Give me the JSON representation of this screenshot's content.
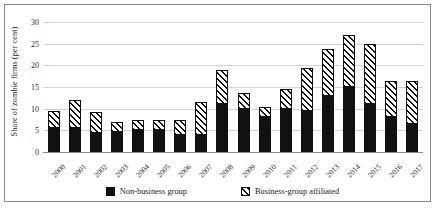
{
  "chart_data": {
    "type": "bar",
    "stacked": true,
    "title": "",
    "xlabel": "",
    "ylabel": "Share of zombie firms (per cent)",
    "ylim": [
      0,
      30
    ],
    "yticks": [
      0,
      5,
      10,
      15,
      20,
      25,
      30
    ],
    "grid": true,
    "legend_position": "bottom",
    "categories": [
      "2000",
      "2001",
      "2002",
      "2003",
      "2004",
      "2005",
      "2006",
      "2007",
      "2008",
      "2009",
      "2010",
      "2011",
      "2012",
      "2013",
      "2014",
      "2015",
      "2016",
      "2017"
    ],
    "series": [
      {
        "name": "Non-business group",
        "pattern": "solid-black",
        "color": "#111111",
        "values": [
          5.5,
          5.5,
          4.3,
          4.7,
          5.0,
          5.0,
          4.0,
          4.0,
          11.0,
          10.0,
          8.0,
          10.0,
          9.5,
          13.0,
          15.0,
          11.0,
          8.0,
          6.5
        ]
      },
      {
        "name": "Business-group affiliated",
        "pattern": "diagonal-hatch",
        "color": "#ffffff",
        "values": [
          4.0,
          6.5,
          5.0,
          2.3,
          2.5,
          2.3,
          3.3,
          7.5,
          8.0,
          3.7,
          2.3,
          4.5,
          10.0,
          10.7,
          12.0,
          14.0,
          8.5,
          10.0
        ]
      }
    ],
    "totals": [
      9.5,
      12.0,
      9.3,
      7.0,
      7.5,
      7.3,
      7.3,
      11.5,
      19.0,
      13.7,
      10.3,
      14.5,
      19.5,
      23.7,
      27.0,
      25.0,
      16.5,
      16.5
    ]
  },
  "legend": {
    "items": [
      {
        "label": "Non-business group"
      },
      {
        "label": "Business-group affiliated"
      }
    ]
  },
  "caption": {
    "text": ""
  }
}
